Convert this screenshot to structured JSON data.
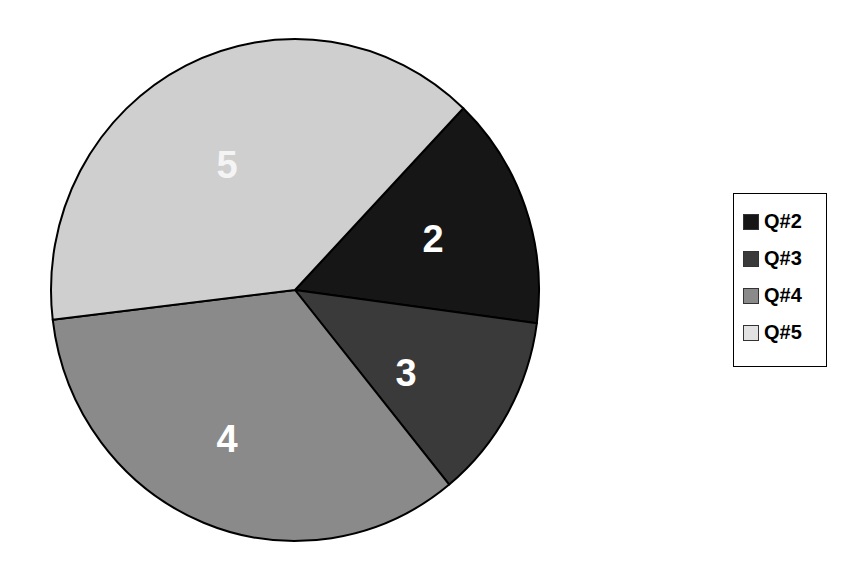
{
  "chart_data": {
    "type": "pie",
    "title": "",
    "categories": [
      "Q#2",
      "Q#3",
      "Q#4",
      "Q#5"
    ],
    "values": [
      15,
      12,
      34,
      39
    ],
    "slice_labels": [
      "2",
      "3",
      "4",
      "5"
    ],
    "colors": [
      "#161616",
      "#3a3a3a",
      "#8a8a8a",
      "#cfcfcf"
    ],
    "start_angle_deg": 43.6,
    "direction": "clockwise",
    "legend": {
      "position": "right",
      "entries": [
        "Q#2",
        "Q#3",
        "Q#4",
        "Q#5"
      ]
    }
  },
  "legend": {
    "items": [
      {
        "label": "Q#2",
        "color": "#161616"
      },
      {
        "label": "Q#3",
        "color": "#3a3a3a"
      },
      {
        "label": "Q#4",
        "color": "#8a8a8a"
      },
      {
        "label": "Q#5",
        "color": "#d6d6d6"
      }
    ]
  },
  "slices": {
    "q2": {
      "label": "2"
    },
    "q3": {
      "label": "3"
    },
    "q4": {
      "label": "4"
    },
    "q5": {
      "label": "5"
    }
  }
}
